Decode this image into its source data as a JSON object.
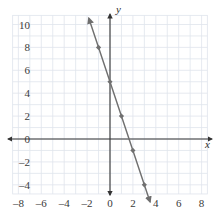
{
  "chart_data": {
    "type": "line",
    "title": "",
    "xlabel": "x",
    "ylabel": "y",
    "xlim": [
      -9,
      9
    ],
    "ylim": [
      -5,
      11
    ],
    "xticks": [
      -8,
      -6,
      -4,
      -2,
      0,
      2,
      4,
      6,
      8
    ],
    "yticks": [
      10,
      8,
      6,
      4,
      2,
      0,
      -2,
      -4
    ],
    "xtick_labels": [
      "-8",
      "-6",
      "-4",
      "-2",
      "0",
      "2",
      "4",
      "6",
      "8"
    ],
    "ytick_labels": [
      "10",
      "8",
      "6",
      "4",
      "2",
      "0",
      "-2",
      "-4"
    ],
    "grid": true,
    "grid_color": "#dfe4ec",
    "grid_spacing": 1,
    "grid_xrange": [
      -8.5,
      8.5
    ],
    "grid_yrange": [
      -4.8,
      10.8
    ],
    "axis_color": "#333333",
    "legend": null,
    "series": [
      {
        "name": "y = -3x + 5",
        "type": "line",
        "color": "#6e6e6e",
        "slope": -3,
        "intercept": 5,
        "arrow_start": {
          "x": -1.85,
          "y": 10.55
        },
        "arrow_end": {
          "x": 3.5,
          "y": -5.5
        },
        "marker": "diamond",
        "marker_color": "#707070",
        "points": [
          {
            "x": -1,
            "y": 8
          },
          {
            "x": 0,
            "y": 5
          },
          {
            "x": 1,
            "y": 2
          },
          {
            "x": 2,
            "y": -1
          },
          {
            "x": 3,
            "y": -4
          }
        ]
      }
    ]
  }
}
